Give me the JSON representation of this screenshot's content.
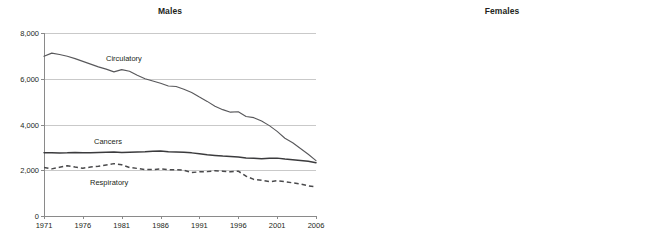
{
  "header": {
    "cropped_top_text": "Health: mortality by cause"
  },
  "axis": {
    "y_ticks": [
      "0",
      "2,000",
      "4,000",
      "6,000",
      "8,000"
    ],
    "y_values": [
      0,
      2000,
      4000,
      6000,
      8000
    ],
    "x_ticks": [
      "1971",
      "1976",
      "1981",
      "1986",
      "1991",
      "1996",
      "2001",
      "2006"
    ],
    "x_values": [
      1971,
      1976,
      1981,
      1986,
      1991,
      1996,
      2001,
      2006
    ]
  },
  "series_labels": {
    "circulatory": "Circulatory",
    "cancers": "Cancers",
    "respiratory": "Respiratory"
  },
  "colors": {
    "line": "#58585b",
    "line_heavy": "#3b3b3d",
    "gridline": "#c9c9c9",
    "axis": "#8a8a8a",
    "text": "#231f20",
    "background": "#ffffff"
  },
  "chart_data": [
    {
      "type": "line",
      "title": "Males",
      "xlabel": "",
      "ylabel": "",
      "xlim": [
        1971,
        2006
      ],
      "ylim": [
        0,
        8000
      ],
      "grid": true,
      "legend": "inline-labels",
      "x": [
        1971,
        1972,
        1973,
        1974,
        1975,
        1976,
        1977,
        1978,
        1979,
        1980,
        1981,
        1982,
        1983,
        1984,
        1985,
        1986,
        1987,
        1988,
        1989,
        1990,
        1991,
        1992,
        1993,
        1994,
        1995,
        1996,
        1997,
        1998,
        1999,
        2000,
        2001,
        2002,
        2003,
        2004,
        2005,
        2006
      ],
      "series": [
        {
          "name": "Circulatory",
          "style": "solid",
          "values": [
            6980,
            7120,
            7060,
            6980,
            6880,
            6760,
            6640,
            6520,
            6420,
            6300,
            6400,
            6330,
            6150,
            6000,
            5900,
            5800,
            5680,
            5660,
            5540,
            5400,
            5200,
            5010,
            4800,
            4650,
            4540,
            4560,
            4350,
            4300,
            4150,
            3950,
            3700,
            3400,
            3200,
            2950,
            2700,
            2420
          ]
        },
        {
          "name": "Cancers",
          "style": "heavy",
          "values": [
            2770,
            2760,
            2750,
            2760,
            2780,
            2760,
            2770,
            2780,
            2790,
            2800,
            2780,
            2790,
            2800,
            2810,
            2830,
            2840,
            2810,
            2800,
            2790,
            2760,
            2720,
            2680,
            2650,
            2620,
            2600,
            2580,
            2540,
            2520,
            2500,
            2520,
            2530,
            2490,
            2460,
            2430,
            2390,
            2330
          ]
        },
        {
          "name": "Respiratory",
          "style": "dashed",
          "values": [
            2120,
            2060,
            2130,
            2200,
            2140,
            2090,
            2140,
            2170,
            2230,
            2290,
            2240,
            2120,
            2080,
            2030,
            2030,
            2060,
            2020,
            2020,
            2000,
            1900,
            1930,
            1940,
            1980,
            1960,
            1930,
            1960,
            1740,
            1600,
            1560,
            1500,
            1540,
            1500,
            1450,
            1400,
            1320,
            1270
          ]
        }
      ]
    },
    {
      "type": "line",
      "title": "Females",
      "xlabel": "",
      "ylabel": "",
      "xlim": [
        1971,
        2006
      ],
      "ylim": [
        0,
        8000
      ],
      "grid": true,
      "legend": "inline-labels",
      "x": [
        1971,
        1972,
        1973,
        1974,
        1975,
        1976,
        1977,
        1978,
        1979,
        1980,
        1981,
        1982,
        1983,
        1984,
        1985,
        1986,
        1987,
        1988,
        1989,
        1990,
        1991,
        1992,
        1993,
        1994,
        1995,
        1996,
        1997,
        1998,
        1999,
        2000,
        2001,
        2002,
        2003,
        2004,
        2005,
        2006
      ],
      "series": [
        {
          "name": "Circulatory",
          "style": "solid",
          "values": [
            4280,
            4340,
            4300,
            4260,
            4220,
            4150,
            4060,
            3980,
            3920,
            3860,
            3900,
            3820,
            3700,
            3600,
            3560,
            3580,
            3480,
            3420,
            3360,
            3280,
            3180,
            3080,
            3000,
            2940,
            2880,
            2900,
            2780,
            2700,
            2620,
            2540,
            2440,
            2400,
            2240,
            2120,
            1980,
            1720
          ]
        },
        {
          "name": "Cancers",
          "style": "heavy",
          "values": [
            1840,
            1845,
            1850,
            1855,
            1860,
            1865,
            1870,
            1875,
            1880,
            1885,
            1890,
            1895,
            1900,
            1905,
            1910,
            1915,
            1918,
            1920,
            1922,
            1924,
            1925,
            1926,
            1928,
            1930,
            1932,
            1935,
            1936,
            1938,
            1940,
            1938,
            1930,
            1900,
            1870,
            1840,
            1800,
            1720
          ]
        },
        {
          "name": "Respiratory",
          "style": "dashed",
          "values": [
            1050,
            1010,
            1080,
            1130,
            1120,
            1080,
            1110,
            1130,
            1180,
            1210,
            1170,
            1100,
            1080,
            1060,
            1050,
            1080,
            1060,
            1060,
            1070,
            1020,
            1040,
            1060,
            1120,
            1110,
            1090,
            1110,
            950,
            900,
            890,
            880,
            900,
            880,
            870,
            850,
            820,
            790
          ]
        }
      ]
    }
  ]
}
